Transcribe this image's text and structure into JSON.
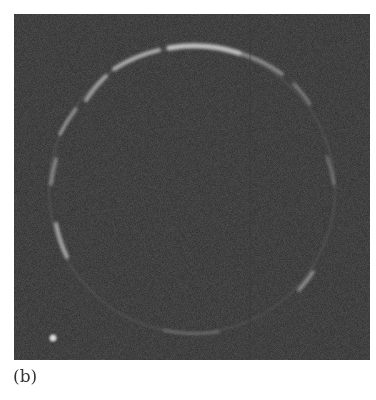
{
  "figure": {
    "panel_label": "(b)",
    "colors": {
      "background": "#2b2b2b",
      "ring": "#bdbdbd",
      "page": "#ffffff"
    }
  }
}
